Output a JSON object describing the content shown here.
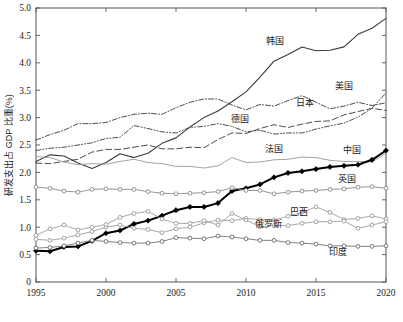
{
  "chart_data": {
    "type": "line",
    "title": "",
    "xlabel": "",
    "ylabel": "研发支出占 GDP 比重(%)",
    "xlim": [
      1995,
      2020
    ],
    "ylim": [
      0,
      5.0
    ],
    "grid": false,
    "legend_position": "inline-labels",
    "xticks": [
      "1995",
      "2000",
      "2005",
      "2010",
      "2015",
      "2020"
    ],
    "xtick_values": [
      1995,
      2000,
      2005,
      2010,
      2015,
      2020
    ],
    "yticks": [
      "0",
      "0.5",
      "1.0",
      "1.5",
      "2.0",
      "2.5",
      "3.0",
      "3.5",
      "4.0",
      "4.5",
      "5.0"
    ],
    "ytick_values": [
      0,
      0.5,
      1.0,
      1.5,
      2.0,
      2.5,
      3.0,
      3.5,
      4.0,
      4.5,
      5.0
    ],
    "x": [
      1995,
      1996,
      1997,
      1998,
      1999,
      2000,
      2001,
      2002,
      2003,
      2004,
      2005,
      2006,
      2007,
      2008,
      2009,
      2010,
      2011,
      2012,
      2013,
      2014,
      2015,
      2016,
      2017,
      2018,
      2019,
      2020
    ],
    "series": [
      {
        "name": "韩国",
        "label": "韩国",
        "label_x": 2012.1,
        "label_y": 4.35,
        "color": "#3a3a3a",
        "width": 1.1,
        "dash": "none",
        "marker": "none",
        "values": [
          2.2,
          2.32,
          2.3,
          2.17,
          2.07,
          2.18,
          2.34,
          2.27,
          2.35,
          2.53,
          2.63,
          2.83,
          3.0,
          3.12,
          3.29,
          3.47,
          3.74,
          4.03,
          4.15,
          4.29,
          4.22,
          4.23,
          4.29,
          4.52,
          4.63,
          4.81
        ]
      },
      {
        "name": "日本",
        "label": "日本",
        "label_x": 2014.2,
        "label_y": 3.22,
        "color": "#3a3a3a",
        "width": 0.9,
        "dash": "5,2,1,2",
        "marker": "none",
        "values": [
          2.59,
          2.69,
          2.77,
          2.89,
          2.89,
          2.91,
          3.0,
          3.06,
          3.08,
          3.06,
          3.18,
          3.28,
          3.34,
          3.34,
          3.23,
          3.14,
          3.24,
          3.21,
          3.31,
          3.4,
          3.28,
          3.16,
          3.21,
          3.28,
          3.22,
          3.27
        ]
      },
      {
        "name": "美国",
        "label": "美国",
        "label_x": 2017.0,
        "label_y": 3.52,
        "color": "#3a3a3a",
        "width": 0.9,
        "dash": "5,2,1,2,1,2",
        "marker": "none",
        "values": [
          2.4,
          2.44,
          2.46,
          2.5,
          2.54,
          2.62,
          2.64,
          2.855,
          2.8,
          2.74,
          2.72,
          2.82,
          2.84,
          2.89,
          2.84,
          2.74,
          2.77,
          2.7,
          2.72,
          2.72,
          2.79,
          2.85,
          2.9,
          3.01,
          3.17,
          3.45
        ]
      },
      {
        "name": "德国",
        "label": "德国",
        "label_x": 2009.6,
        "label_y": 2.92,
        "color": "#3a3a3a",
        "width": 0.9,
        "dash": "6,3",
        "marker": "none",
        "values": [
          2.17,
          2.16,
          2.2,
          2.24,
          2.37,
          2.42,
          2.42,
          2.46,
          2.5,
          2.43,
          2.43,
          2.46,
          2.45,
          2.6,
          2.72,
          2.71,
          2.8,
          2.87,
          2.82,
          2.88,
          2.93,
          2.94,
          3.05,
          3.11,
          3.17,
          3.13
        ]
      },
      {
        "name": "法国",
        "label": "法国",
        "label_x": 2012.0,
        "label_y": 2.38,
        "color": "#9a9a9a",
        "width": 0.9,
        "dash": "none",
        "marker": "none",
        "values": [
          2.29,
          2.27,
          2.19,
          2.14,
          2.16,
          2.15,
          2.2,
          2.24,
          2.18,
          2.16,
          2.11,
          2.11,
          2.08,
          2.12,
          2.27,
          2.18,
          2.19,
          2.23,
          2.24,
          2.28,
          2.27,
          2.22,
          2.2,
          2.2,
          2.19,
          2.35
        ]
      },
      {
        "name": "中国",
        "label": "中国",
        "label_x": 2017.6,
        "label_y": 2.36,
        "color": "#000000",
        "width": 2.0,
        "dash": "none",
        "marker": "diamond",
        "values": [
          0.57,
          0.56,
          0.64,
          0.65,
          0.75,
          0.89,
          0.94,
          1.06,
          1.12,
          1.21,
          1.31,
          1.37,
          1.37,
          1.44,
          1.66,
          1.71,
          1.78,
          1.91,
          1.99,
          2.02,
          2.06,
          2.1,
          2.12,
          2.14,
          2.23,
          2.4
        ]
      },
      {
        "name": "英国",
        "label": "英国",
        "label_x": 2017.2,
        "label_y": 1.83,
        "color": "#8a8a8a",
        "width": 0.9,
        "dash": "none",
        "marker": "circle",
        "values": [
          1.73,
          1.71,
          1.66,
          1.64,
          1.69,
          1.7,
          1.69,
          1.69,
          1.65,
          1.62,
          1.61,
          1.62,
          1.63,
          1.65,
          1.72,
          1.67,
          1.67,
          1.61,
          1.64,
          1.66,
          1.67,
          1.69,
          1.7,
          1.73,
          1.74,
          1.71
        ]
      },
      {
        "name": "巴西",
        "label": "巴西",
        "label_x": 2013.8,
        "label_y": 1.23,
        "color": "#9a9a9a",
        "width": 0.85,
        "dash": "none",
        "marker": "circle",
        "values": [
          0.78,
          0.76,
          0.8,
          0.86,
          0.92,
          1.0,
          1.04,
          0.98,
          0.96,
          0.9,
          0.97,
          1.0,
          1.08,
          1.13,
          1.12,
          1.16,
          1.14,
          1.13,
          1.2,
          1.27,
          1.37,
          1.27,
          1.14,
          1.16,
          1.21,
          1.15
        ]
      },
      {
        "name": "俄罗斯",
        "label": "俄罗斯",
        "label_x": 2011.6,
        "label_y": 1.01,
        "color": "#9a9a9a",
        "width": 0.85,
        "dash": "none",
        "marker": "circle",
        "values": [
          0.85,
          0.97,
          1.04,
          0.95,
          1.0,
          1.05,
          1.18,
          1.25,
          1.29,
          1.15,
          1.07,
          1.07,
          1.12,
          1.04,
          1.25,
          1.13,
          1.01,
          1.03,
          1.03,
          1.07,
          1.1,
          1.1,
          1.11,
          0.98,
          1.04,
          1.1
        ]
      },
      {
        "name": "印度",
        "label": "印度",
        "label_x": 2016.6,
        "label_y": 0.5,
        "color": "#6a6a6a",
        "width": 0.85,
        "dash": "none",
        "marker": "circle",
        "values": [
          0.62,
          0.63,
          0.66,
          0.71,
          0.76,
          0.74,
          0.72,
          0.71,
          0.71,
          0.74,
          0.81,
          0.8,
          0.79,
          0.84,
          0.82,
          0.79,
          0.76,
          0.76,
          0.72,
          0.71,
          0.69,
          0.66,
          0.66,
          0.65,
          0.65,
          0.66
        ]
      }
    ]
  }
}
